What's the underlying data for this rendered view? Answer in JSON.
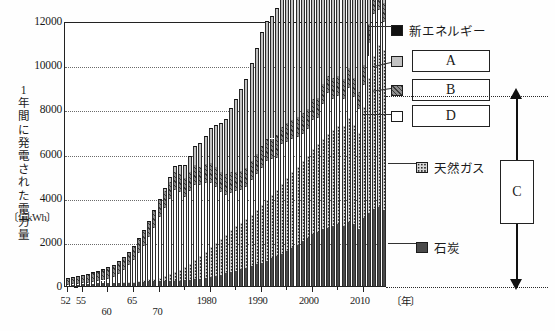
{
  "figure": {
    "title_hidden": "日本の発電電力量の推移（電源別）",
    "y_axis_label": "1年間に発電された電力量",
    "y_axis_unit": "〔億kWh〕",
    "x_axis_unit": "〔年〕"
  },
  "legend": {
    "new_energy": {
      "label": "新エネルギー",
      "swatch": "black-solid",
      "color": "#111111"
    },
    "a": {
      "label": "A",
      "swatch": "light-gray-solid",
      "color": "#c2c2c2"
    },
    "b": {
      "label": "B",
      "swatch": "dark-hatched",
      "color": "#8c8c8c"
    },
    "d": {
      "label": "D",
      "swatch": "white-solid",
      "color": "#ffffff"
    },
    "natural_gas": {
      "label": "天然ガス",
      "swatch": "dotted-stipple",
      "color": "#d9d9d9"
    },
    "coal": {
      "label": "石炭",
      "swatch": "dark-gray-solid",
      "color": "#4a4a4a"
    },
    "c_bracket": {
      "label": "C"
    }
  },
  "chart_data": {
    "type": "bar",
    "stacked": true,
    "title": "",
    "xlabel": "〔年〕",
    "ylabel": "1年間に発電された電力量 〔億kWh〕",
    "ylim": [
      0,
      12000
    ],
    "yticks": [
      0,
      2000,
      4000,
      6000,
      8000,
      10000,
      12000
    ],
    "grid": "horizontal-dotted",
    "legend_position": "right",
    "xticks_labeled": [
      "52",
      "55",
      "60",
      "65",
      "70",
      "1980",
      "1990",
      "2000",
      "2010"
    ],
    "x": [
      1952,
      1953,
      1954,
      1955,
      1956,
      1957,
      1958,
      1959,
      1960,
      1961,
      1962,
      1963,
      1964,
      1965,
      1966,
      1967,
      1968,
      1969,
      1970,
      1971,
      1972,
      1973,
      1974,
      1975,
      1976,
      1977,
      1978,
      1979,
      1980,
      1981,
      1982,
      1983,
      1984,
      1985,
      1986,
      1987,
      1988,
      1989,
      1990,
      1991,
      1992,
      1993,
      1994,
      1995,
      1996,
      1997,
      1998,
      1999,
      2000,
      2001,
      2002,
      2003,
      2004,
      2005,
      2006,
      2007,
      2008,
      2009,
      2010,
      2011,
      2012,
      2013,
      2014
    ],
    "series": [
      {
        "name": "石炭",
        "key": "coal",
        "values": [
          60,
          70,
          80,
          90,
          100,
          110,
          115,
          120,
          130,
          140,
          150,
          160,
          170,
          180,
          190,
          200,
          210,
          215,
          220,
          225,
          230,
          235,
          240,
          250,
          270,
          300,
          340,
          380,
          420,
          470,
          520,
          580,
          640,
          700,
          760,
          830,
          900,
          980,
          1060,
          1150,
          1250,
          1350,
          1470,
          1600,
          1730,
          1870,
          2020,
          2180,
          2350,
          2450,
          2560,
          2620,
          2700,
          2800,
          2700,
          2900,
          2800,
          2600,
          3100,
          3300,
          3500,
          3600,
          3450
        ]
      },
      {
        "name": "天然ガス",
        "key": "natural_gas",
        "values": [
          0,
          0,
          0,
          0,
          0,
          0,
          0,
          0,
          0,
          0,
          0,
          5,
          10,
          20,
          40,
          60,
          90,
          120,
          160,
          220,
          300,
          400,
          500,
          600,
          720,
          860,
          1020,
          1180,
          1350,
          1500,
          1620,
          1750,
          1880,
          2000,
          2100,
          2200,
          2330,
          2470,
          2600,
          2750,
          2880,
          2980,
          3150,
          3300,
          3420,
          3530,
          3620,
          3720,
          3850,
          3980,
          4100,
          4250,
          4350,
          4450,
          4560,
          4700,
          4500,
          4350,
          5000,
          6100,
          6900,
          7300,
          7250
        ]
      },
      {
        "name": "D(石油)",
        "key": "oil_d",
        "values": [
          5,
          10,
          15,
          25,
          40,
          60,
          90,
          130,
          190,
          280,
          400,
          560,
          760,
          980,
          1250,
          1560,
          1900,
          2300,
          2750,
          3100,
          3400,
          3700,
          3500,
          3200,
          3300,
          3400,
          3200,
          3100,
          2900,
          2500,
          2100,
          1800,
          1700,
          1600,
          1500,
          1450,
          1550,
          1600,
          1700,
          1750,
          1600,
          1450,
          1800,
          1600,
          1500,
          1350,
          1250,
          1200,
          1300,
          1200,
          1600,
          1850,
          1400,
          1350,
          1200,
          1350,
          1250,
          1050,
          1000,
          1600,
          1900,
          1600,
          1250
        ]
      },
      {
        "name": "B(水力)",
        "key": "hydro_b",
        "values": [
          320,
          350,
          380,
          400,
          420,
          450,
          470,
          500,
          520,
          550,
          580,
          600,
          620,
          650,
          670,
          690,
          720,
          740,
          760,
          780,
          800,
          820,
          840,
          860,
          880,
          900,
          820,
          850,
          880,
          900,
          920,
          940,
          960,
          860,
          870,
          880,
          900,
          950,
          980,
          1000,
          950,
          1050,
          800,
          900,
          850,
          900,
          960,
          910,
          960,
          900,
          900,
          800,
          950,
          900,
          920,
          900,
          850,
          800,
          900,
          880,
          850,
          850,
          870
        ]
      },
      {
        "name": "A(原子力)",
        "key": "nuclear_a",
        "values": [
          0,
          0,
          0,
          0,
          0,
          0,
          0,
          0,
          0,
          0,
          0,
          0,
          0,
          0,
          5,
          10,
          20,
          40,
          60,
          120,
          200,
          300,
          420,
          560,
          720,
          900,
          1100,
          1300,
          1600,
          1900,
          2200,
          2500,
          2900,
          3300,
          3700,
          4000,
          4400,
          4800,
          5100,
          5300,
          5500,
          5700,
          5900,
          6100,
          6300,
          6500,
          6700,
          6900,
          7000,
          6900,
          6800,
          6500,
          6800,
          7000,
          7200,
          7100,
          6500,
          6200,
          6100,
          1500,
          400,
          200,
          150
        ]
      },
      {
        "name": "新エネルギー",
        "key": "new_energy",
        "values": [
          0,
          0,
          0,
          0,
          0,
          0,
          0,
          0,
          0,
          0,
          0,
          0,
          0,
          0,
          0,
          0,
          0,
          0,
          0,
          0,
          0,
          0,
          0,
          0,
          0,
          0,
          0,
          0,
          0,
          0,
          0,
          0,
          0,
          0,
          0,
          0,
          0,
          0,
          20,
          25,
          30,
          35,
          40,
          45,
          50,
          55,
          60,
          65,
          70,
          80,
          90,
          100,
          110,
          120,
          130,
          140,
          150,
          160,
          180,
          250,
          350,
          500,
          700
        ]
      }
    ],
    "totals_note": "2011年以降にA(原子力)が急減し、天然ガス・石炭が増加",
    "annotations": [
      {
        "text": "C",
        "type": "bracket-arrow",
        "meaning": "火力発電の合計範囲"
      }
    ]
  },
  "xticks": [
    {
      "label": "52",
      "year": 1952
    },
    {
      "label": "55",
      "year": 1955
    },
    {
      "label": "60",
      "year": 1960
    },
    {
      "label": "65",
      "year": 1965
    },
    {
      "label": "70",
      "year": 1970
    },
    {
      "label": "1980",
      "year": 1980
    },
    {
      "label": "1990",
      "year": 1990
    },
    {
      "label": "2000",
      "year": 2000
    },
    {
      "label": "2010",
      "year": 2010
    }
  ],
  "yticks": [
    {
      "label": "12000",
      "value": 12000
    },
    {
      "label": "10000",
      "value": 10000
    },
    {
      "label": "8000",
      "value": 8000
    },
    {
      "label": "6000",
      "value": 6000
    },
    {
      "label": "4000",
      "value": 4000
    },
    {
      "label": "2000",
      "value": 2000
    },
    {
      "label": "0",
      "value": 0
    }
  ]
}
